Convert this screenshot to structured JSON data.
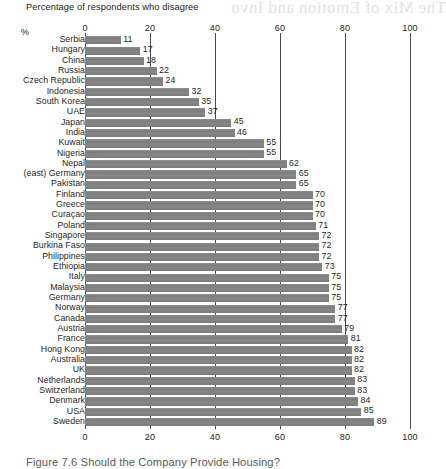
{
  "subtitle": "Percentage of respondents who disagree",
  "axis_unit_label": "%",
  "caption": "Figure 7.6  Should the Company Provide Housing?",
  "bleed_through_text": "The Mix of Emotion and Invo",
  "colors": {
    "bar": "#828282",
    "gridline": "#4a4a4a",
    "text": "#1f1f1f",
    "caption": "#5b5b5b",
    "background": "#ffffff"
  },
  "chart_data": {
    "type": "bar",
    "orientation": "horizontal",
    "title": "Figure 7.6  Should the Company Provide Housing?",
    "subtitle": "Percentage of respondents who disagree",
    "xlabel": "%",
    "ylabel": "",
    "xlim": [
      0,
      100
    ],
    "xticks": [
      0,
      20,
      40,
      60,
      80,
      100
    ],
    "grid": "vertical-only",
    "legend": "none",
    "data_labels": true,
    "categories": [
      "Serbia",
      "Hungary",
      "China",
      "Russia",
      "Czech Republic",
      "Indonesia",
      "South Korea",
      "UAE",
      "Japan",
      "India",
      "Kuwait",
      "Nigeria",
      "Nepal",
      "(east) Germany",
      "Pakistan",
      "Finland",
      "Greece",
      "Curaçao",
      "Poland",
      "Singapore",
      "Burkina Faso",
      "Philippines",
      "Ethiopia",
      "Italy",
      "Malaysia",
      "Germany",
      "Norway",
      "Canada",
      "Austria",
      "France",
      "Hong Kong",
      "Australia",
      "UK",
      "Netherlands",
      "Switzerland",
      "Denmark",
      "USA",
      "Sweden"
    ],
    "values": [
      11,
      17,
      18,
      22,
      24,
      32,
      35,
      37,
      45,
      46,
      55,
      55,
      62,
      65,
      65,
      70,
      70,
      70,
      71,
      72,
      72,
      72,
      73,
      75,
      75,
      75,
      77,
      77,
      79,
      81,
      82,
      82,
      82,
      83,
      83,
      84,
      85,
      89
    ]
  }
}
